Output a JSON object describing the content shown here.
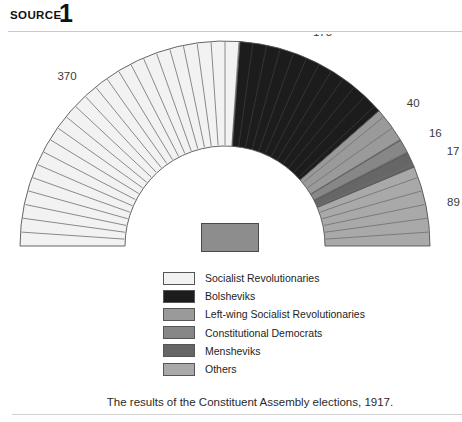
{
  "header": {
    "label": "SOURCE",
    "number": "1"
  },
  "caption": {
    "text": "The results of the Constituent Assembly elections, 1917."
  },
  "colors": {
    "socialist_revolutionaries": "#f2f2f2",
    "bolsheviks": "#1c1c1c",
    "left_wing_sr": "#9a9a9a",
    "constitutional_democrats": "#878787",
    "mensheviks": "#666666",
    "others": "#a9a9a9",
    "outline": "#555555",
    "label_text": "#3a3a3a",
    "rule": "#c9c9c9",
    "center_block": "#8d8d8d"
  },
  "legend": {
    "items": [
      {
        "label": "Socialist Revolutionaries",
        "color": "#f2f2f2"
      },
      {
        "label": "Bolsheviks",
        "color": "#1c1c1c"
      },
      {
        "label": "Left-wing Socialist Revolutionaries",
        "color": "#9a9a9a"
      },
      {
        "label": "Constitutional Democrats",
        "color": "#878787"
      },
      {
        "label": "Mensheviks",
        "color": "#666666"
      },
      {
        "label": "Others",
        "color": "#a9a9a9"
      }
    ]
  },
  "chart_data": {
    "type": "pie",
    "subtype": "hemicycle",
    "title": "",
    "total_seats": 707,
    "categories": [
      "Socialist Revolutionaries",
      "Bolsheviks",
      "Left-wing Socialist Revolutionaries",
      "Constitutional Democrats",
      "Mensheviks",
      "Others"
    ],
    "values": [
      370,
      175,
      40,
      16,
      17,
      89
    ],
    "labels": [
      "370",
      "175",
      "40",
      "16",
      "17",
      "89"
    ],
    "colors": [
      "#f2f2f2",
      "#1c1c1c",
      "#9a9a9a",
      "#878787",
      "#666666",
      "#a9a9a9"
    ],
    "legend_position": "below",
    "grid": false,
    "seat_divider_lines": true
  }
}
